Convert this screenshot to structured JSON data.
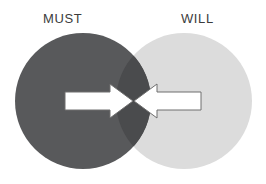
{
  "diagram": {
    "type": "venn",
    "title": "",
    "width": 266,
    "height": 184,
    "background_color": "#ffffff",
    "left_set": {
      "label": "MUST",
      "fill_color": "#58595b",
      "center_x": 83,
      "center_y": 101,
      "radius": 68,
      "label_x": 43,
      "label_y": 12
    },
    "right_set": {
      "label": "WILL",
      "fill_color": "#dcdcdc",
      "center_x": 184,
      "center_y": 101,
      "radius": 68,
      "label_x": 181,
      "label_y": 12
    },
    "intersection": {
      "label": "",
      "fill_color": "#4a4b4d"
    },
    "label_color": "#3c3c3c",
    "arrows": [
      {
        "name": "left-arrow",
        "direction": "right",
        "fill_color": "#ffffff",
        "stroke_color": "#6e6e6e",
        "tail_x": 65,
        "tip_x": 133,
        "center_y": 101,
        "shaft_half_height": 9,
        "head_half_height": 17,
        "head_length": 23
      },
      {
        "name": "right-arrow",
        "direction": "left",
        "fill_color": "#ffffff",
        "stroke_color": "#6e6e6e",
        "tail_x": 201,
        "tip_x": 134,
        "center_y": 101,
        "shaft_half_height": 9,
        "head_half_height": 17,
        "head_length": 23
      }
    ]
  }
}
